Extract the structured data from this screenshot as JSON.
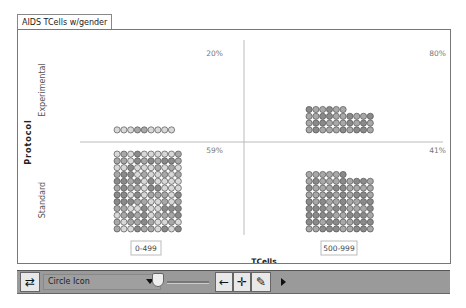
{
  "window": {
    "tab_title": "AIDS TCells w/gender"
  },
  "chart_data": {
    "type": "mosaic-icon-plot",
    "title": "",
    "xlabel": "TCells",
    "ylabel": "Protocol",
    "x_categories": [
      "0-499",
      "500-999"
    ],
    "y_categories": [
      "Experimental",
      "Standard"
    ],
    "cells": [
      {
        "protocol": "Experimental",
        "tcells": "0-499",
        "percent_label": "20%",
        "count": 9
      },
      {
        "protocol": "Experimental",
        "tcells": "500-999",
        "percent_label": "80%",
        "count": 36
      },
      {
        "protocol": "Standard",
        "tcells": "0-499",
        "percent_label": "59%",
        "count": 120
      },
      {
        "protocol": "Standard",
        "tcells": "500-999",
        "percent_label": "41%",
        "count": 86
      }
    ],
    "icon_shape": "circle",
    "grid_columns": 10,
    "colors": {
      "icon_fill_light": "#d8d8d8",
      "icon_fill_mid": "#a8a8a8",
      "icon_fill_dark": "#8a8a8a",
      "icon_stroke": "#555555",
      "divider": "#bbbbbb"
    }
  },
  "toolbar": {
    "icon_select_value": "Circle Icon",
    "swap_icon": "swap-arrows-icon",
    "back_icon": "left-arrow-icon",
    "move_icon": "crosshair-icon",
    "edit_icon": "pencil-icon",
    "more_icon": "play-icon",
    "back_glyph": "←",
    "move_glyph": "✛",
    "edit_glyph": "✎",
    "swap_glyph": "⇄"
  }
}
